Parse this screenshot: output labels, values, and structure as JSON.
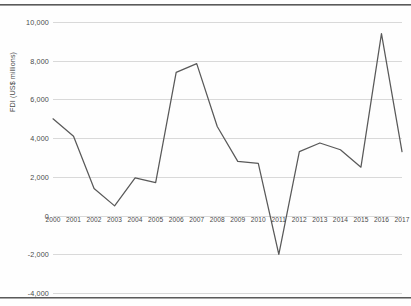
{
  "figure": {
    "background_color": "#fefefe",
    "border_color": "#5a5a5a",
    "gridline_color": "#d9d9d9",
    "line_color": "#595959",
    "tick_text_color": "#4a4a4a"
  },
  "chart_data": {
    "type": "line",
    "title": "",
    "subtitle": "",
    "xlabel": "",
    "ylabel": "FDI (US$ millions)",
    "categories": [
      "2000",
      "2001",
      "2002",
      "2003",
      "2004",
      "2005",
      "2006",
      "2007",
      "2008",
      "2009",
      "2010",
      "2011",
      "2012",
      "2013",
      "2014",
      "2015",
      "2016",
      "2017"
    ],
    "values": [
      5000,
      4100,
      1400,
      500,
      1950,
      1700,
      7400,
      7850,
      4600,
      2800,
      2700,
      -2000,
      3300,
      3750,
      3400,
      2500,
      9400,
      3300
    ],
    "series": [
      {
        "name": "FDI",
        "values": [
          5000,
          4100,
          1400,
          500,
          1950,
          1700,
          7400,
          7850,
          4600,
          2800,
          2700,
          -2000,
          3300,
          3750,
          3400,
          2500,
          9400,
          3300
        ]
      }
    ],
    "ylim": [
      -4000,
      10000
    ],
    "ytick_labels": [
      "10,000",
      "8,000",
      "6,000",
      "4,000",
      "2,000",
      "0",
      "-2,000",
      "-4,000"
    ],
    "ytick_values": [
      10000,
      8000,
      6000,
      4000,
      2000,
      0,
      -2000,
      -4000
    ],
    "grid": true,
    "grid_axis": "y",
    "legend": false,
    "legend_position": "none",
    "annotations": []
  }
}
